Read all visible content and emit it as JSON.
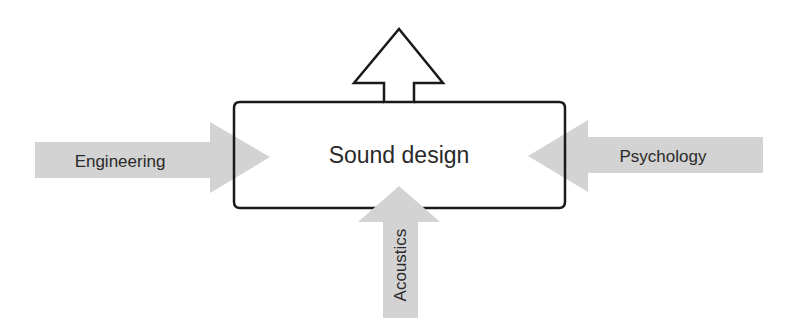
{
  "diagram": {
    "center": {
      "label": "Sound design"
    },
    "inputs": [
      {
        "label": "Engineering",
        "direction": "from-left"
      },
      {
        "label": "Psychology",
        "direction": "from-right"
      },
      {
        "label": "Acoustics",
        "direction": "from-bottom"
      }
    ],
    "output": {
      "direction": "up"
    },
    "colors": {
      "input_arrow_fill": "#d3d3d3",
      "stroke": "#1a1a1a",
      "text": "#2a2a2a",
      "background": "#ffffff"
    }
  }
}
